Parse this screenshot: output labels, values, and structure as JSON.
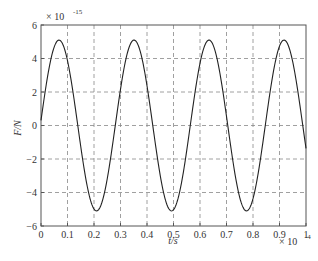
{
  "chart_data": {
    "type": "line",
    "title": "",
    "xlabel": "t/s",
    "ylabel": "F/N",
    "x_multiplier": "× 10",
    "x_multiplier_exp": "-4",
    "y_multiplier": "× 10",
    "y_multiplier_exp": "-15",
    "xlim": [
      0,
      1
    ],
    "ylim": [
      -6,
      6
    ],
    "xticks": [
      0,
      0.1,
      0.2,
      0.3,
      0.4,
      0.5,
      0.6,
      0.7,
      0.8,
      0.9,
      1
    ],
    "xtick_labels": [
      "0",
      "0.1",
      "0.2",
      "0.3",
      "0.4",
      "0.5",
      "0.6",
      "0.7",
      "0.8",
      "0.9",
      "1"
    ],
    "yticks": [
      -6,
      -4,
      -2,
      0,
      2,
      4,
      6
    ],
    "ytick_labels": [
      "−6",
      "−4",
      "−2",
      "0",
      "2",
      "4",
      "6"
    ],
    "grid": true,
    "grid_style": "dashed",
    "legend": null,
    "series": [
      {
        "name": "F(t)",
        "description": "sinusoid, amplitude ≈ 5.1, period ≈ 0.283 (×10⁻⁴ s)",
        "amplitude": 5.1,
        "period": 0.283,
        "phase": 0.06,
        "color": "#222222",
        "key_points": [
          {
            "x": 0.0,
            "y": 0.3
          },
          {
            "x": 0.072,
            "y": 5.1
          },
          {
            "x": 0.213,
            "y": -5.1
          },
          {
            "x": 0.355,
            "y": 5.1
          },
          {
            "x": 0.496,
            "y": -5.1
          },
          {
            "x": 0.638,
            "y": 5.1
          },
          {
            "x": 0.779,
            "y": -5.1
          },
          {
            "x": 0.921,
            "y": 5.1
          },
          {
            "x": 1.0,
            "y": -1.0
          }
        ]
      }
    ]
  }
}
